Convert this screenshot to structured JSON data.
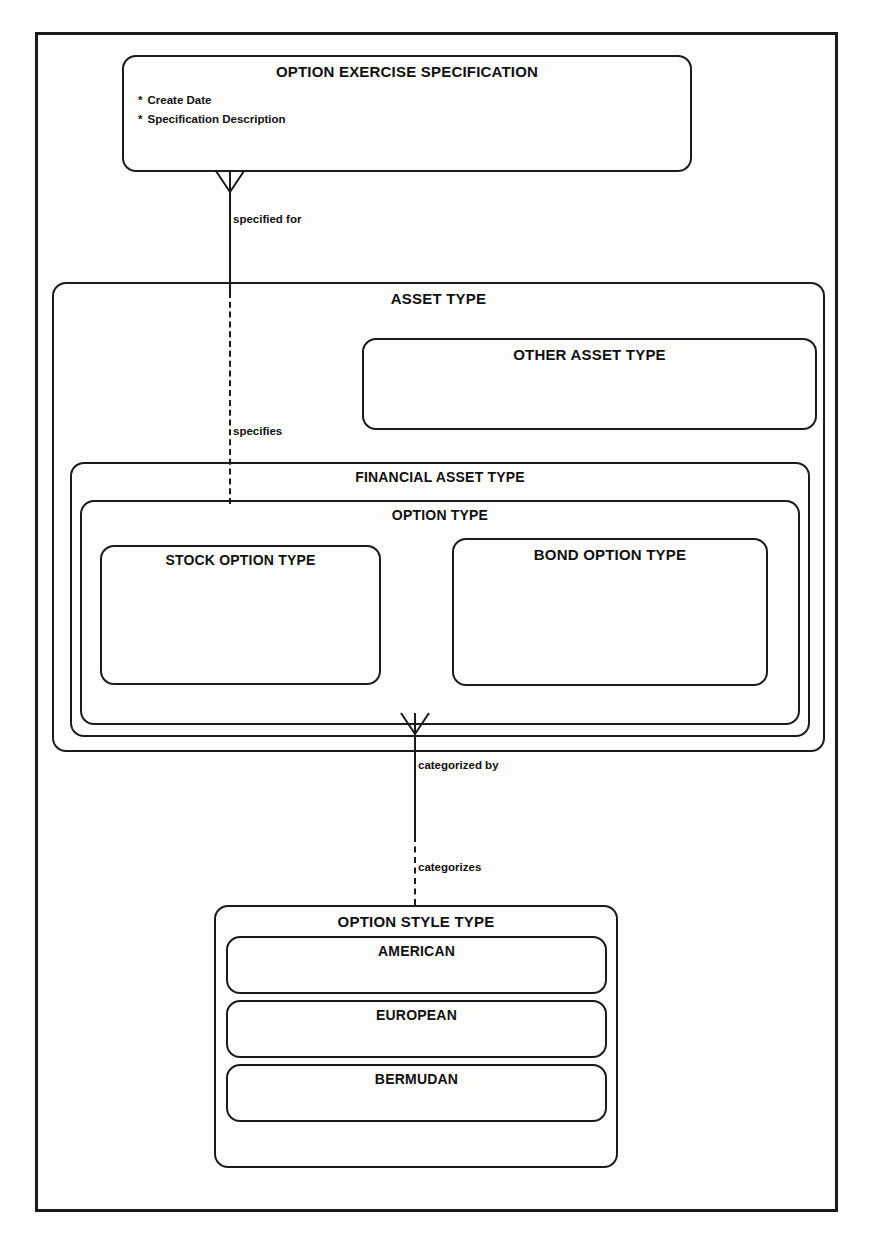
{
  "diagram": {
    "line_color": "#1b1b1b",
    "background": "#fdfdfc"
  },
  "entities": {
    "option_exercise_specification": {
      "label": "OPTION EXERCISE SPECIFICATION",
      "attributes": [
        {
          "bullet": "*",
          "name": "Create Date"
        },
        {
          "bullet": "*",
          "name": "Specification Description"
        }
      ]
    },
    "asset_type": {
      "label": "ASSET TYPE"
    },
    "other_asset_type": {
      "label": "OTHER ASSET TYPE"
    },
    "financial_asset_type": {
      "label": "FINANCIAL ASSET TYPE"
    },
    "option_type": {
      "label": "OPTION TYPE"
    },
    "stock_option_type": {
      "label": "STOCK OPTION TYPE"
    },
    "bond_option_type": {
      "label": "BOND OPTION TYPE"
    },
    "option_style_type": {
      "label": "OPTION STYLE TYPE"
    },
    "american": {
      "label": "AMERICAN"
    },
    "european": {
      "label": "EUROPEAN"
    },
    "bermudan": {
      "label": "BERMUDAN"
    }
  },
  "relationships": {
    "spec_to_asset": {
      "from_label": "specified for",
      "to_label": "specifies"
    },
    "option_to_style": {
      "from_label": "categorized by",
      "to_label": "categorizes"
    }
  }
}
